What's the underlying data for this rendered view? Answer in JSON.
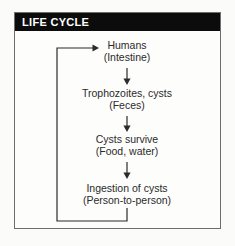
{
  "figure": {
    "header": {
      "title": "LIFE CYCLE"
    },
    "nodes": [
      {
        "label": "Humans",
        "sublabel": "(Intestine)"
      },
      {
        "label": "Trophozoites, cysts",
        "sublabel": "(Feces)"
      },
      {
        "label": "Cysts survive",
        "sublabel": "(Food, water)"
      },
      {
        "label": "Ingestion of cysts",
        "sublabel": "(Person-to-person)"
      }
    ],
    "flow": {
      "down_arrows": 3,
      "feedback_loop": "Ingestion of cysts -> Humans"
    },
    "colors": {
      "header_bg": "#0c0c0c",
      "header_text": "#ffffff",
      "border": "#6e6e6e",
      "line": "#2b2b2b",
      "background": "#fbfbf9"
    }
  }
}
